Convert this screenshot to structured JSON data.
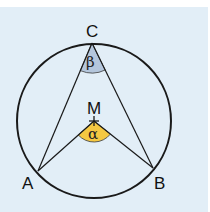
{
  "diagram": {
    "points": {
      "A": {
        "label": "A",
        "x": 38,
        "y": 171
      },
      "B": {
        "label": "B",
        "x": 153,
        "y": 168
      },
      "C": {
        "label": "C",
        "x": 92,
        "y": 43
      },
      "M": {
        "label": "M",
        "x": 94,
        "y": 121
      }
    },
    "angles": {
      "alpha": {
        "label": "α",
        "at": "M",
        "color": "#f5c842"
      },
      "beta": {
        "label": "β",
        "at": "C",
        "color": "#b4c6dc"
      }
    },
    "circle": {
      "center": "M",
      "radius": 77
    },
    "colors": {
      "background": "#e2eef7",
      "stroke": "#1a1a1a"
    }
  }
}
